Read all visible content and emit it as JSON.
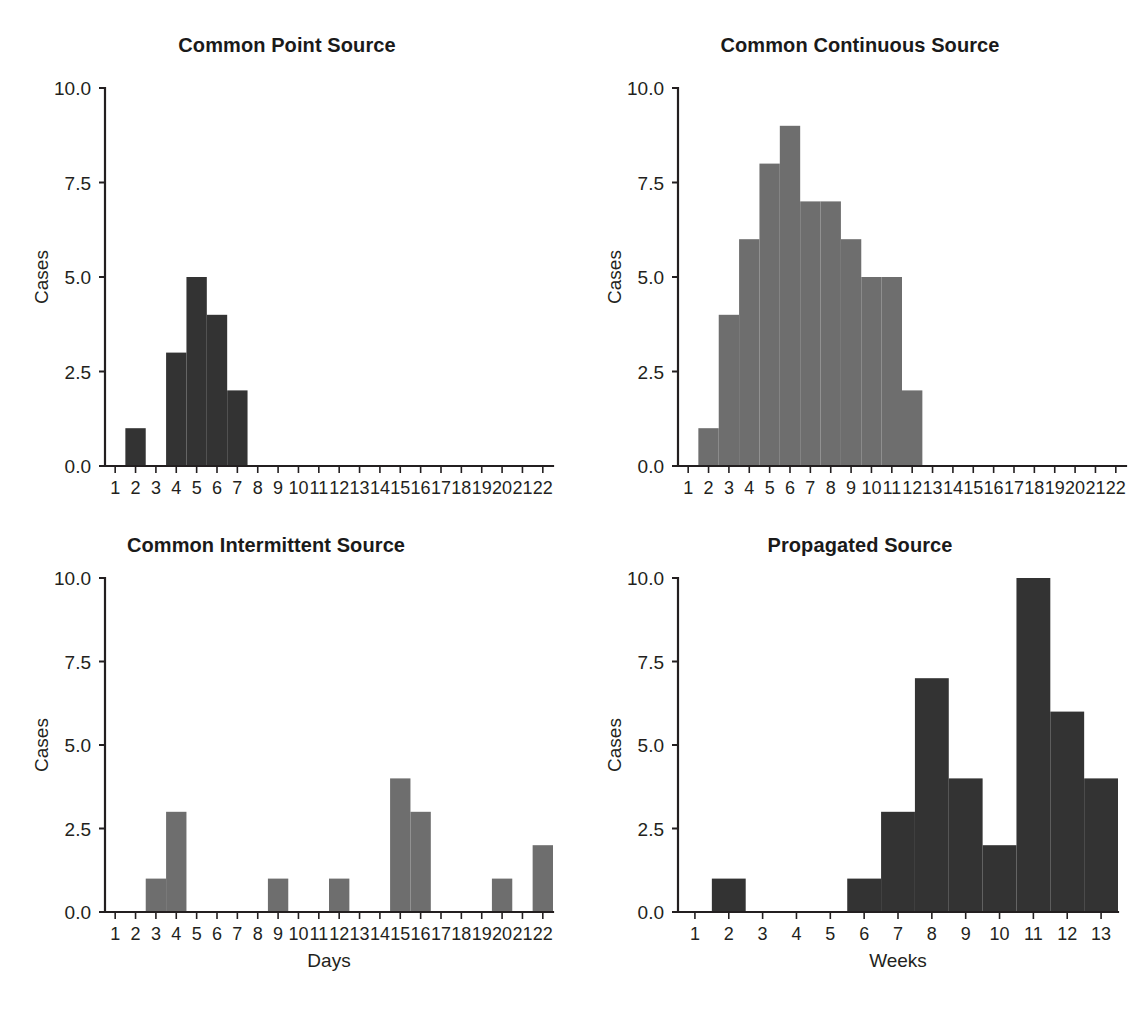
{
  "figure": {
    "background": "#ffffff",
    "bar_color_dark": "#333333",
    "bar_color_gray": "#6e6e6e",
    "axis_color": "#231f20"
  },
  "panels": [
    {
      "id": "common-point-source",
      "title": "Common Point Source",
      "xlabel": "Days",
      "ylabel": "Cases"
    },
    {
      "id": "common-continuous-source",
      "title": "Common Continuous Source",
      "xlabel": "Days",
      "ylabel": "Cases"
    },
    {
      "id": "common-intermittent-source",
      "title": "Common Intermittent Source",
      "xlabel": "Days",
      "ylabel": "Cases"
    },
    {
      "id": "propagated-source",
      "title": "Propagated Source",
      "xlabel": "Weeks",
      "ylabel": "Cases"
    }
  ],
  "chart_data": [
    {
      "type": "bar",
      "title": "Common Point Source",
      "xlabel": "Days",
      "ylabel": "Cases",
      "categories": [
        1,
        2,
        3,
        4,
        5,
        6,
        7,
        8,
        9,
        10,
        11,
        12,
        13,
        14,
        15,
        16,
        17,
        18,
        19,
        20,
        21,
        22
      ],
      "values": [
        0,
        1,
        0,
        3,
        5,
        4,
        2,
        0,
        0,
        0,
        0,
        0,
        0,
        0,
        0,
        0,
        0,
        0,
        0,
        0,
        0,
        0
      ],
      "ylim": [
        0,
        10
      ],
      "yticks": [
        0.0,
        2.5,
        5.0,
        7.5,
        10.0
      ],
      "ytick_labels": [
        "0.0",
        "2.5",
        "5.0",
        "7.5",
        "10.0"
      ],
      "xlim": [
        0.5,
        22.5
      ],
      "grid": false,
      "legend": false,
      "bar_color": "#333333"
    },
    {
      "type": "bar",
      "title": "Common Continuous Source",
      "xlabel": "Days",
      "ylabel": "Cases",
      "categories": [
        1,
        2,
        3,
        4,
        5,
        6,
        7,
        8,
        9,
        10,
        11,
        12,
        13,
        14,
        15,
        16,
        17,
        18,
        19,
        20,
        21,
        22
      ],
      "values": [
        0,
        1,
        4,
        6,
        8,
        9,
        7,
        7,
        6,
        5,
        5,
        2,
        0,
        0,
        0,
        0,
        0,
        0,
        0,
        0,
        0,
        0
      ],
      "ylim": [
        0,
        10
      ],
      "yticks": [
        0.0,
        2.5,
        5.0,
        7.5,
        10.0
      ],
      "ytick_labels": [
        "0.0",
        "2.5",
        "5.0",
        "7.5",
        "10.0"
      ],
      "xlim": [
        0.5,
        22.5
      ],
      "grid": false,
      "legend": false,
      "bar_color": "#6e6e6e"
    },
    {
      "type": "bar",
      "title": "Common Intermittent Source",
      "xlabel": "Days",
      "ylabel": "Cases",
      "categories": [
        1,
        2,
        3,
        4,
        5,
        6,
        7,
        8,
        9,
        10,
        11,
        12,
        13,
        14,
        15,
        16,
        17,
        18,
        19,
        20,
        21,
        22
      ],
      "values": [
        0,
        0,
        1,
        3,
        0,
        0,
        0,
        0,
        1,
        0,
        0,
        1,
        0,
        0,
        4,
        3,
        0,
        0,
        0,
        1,
        0,
        2
      ],
      "ylim": [
        0,
        10
      ],
      "yticks": [
        0.0,
        2.5,
        5.0,
        7.5,
        10.0
      ],
      "ytick_labels": [
        "0.0",
        "2.5",
        "5.0",
        "7.5",
        "10.0"
      ],
      "xlim": [
        0.5,
        22.5
      ],
      "grid": false,
      "legend": false,
      "bar_color": "#6e6e6e"
    },
    {
      "type": "bar",
      "title": "Propagated Source",
      "xlabel": "Weeks",
      "ylabel": "Cases",
      "categories": [
        1,
        2,
        3,
        4,
        5,
        6,
        7,
        8,
        9,
        10,
        11,
        12,
        13
      ],
      "values": [
        0,
        1,
        0,
        0,
        0,
        1,
        3,
        7,
        4,
        2,
        10,
        6,
        4
      ],
      "ylim": [
        0,
        10
      ],
      "yticks": [
        0.0,
        2.5,
        5.0,
        7.5,
        10.0
      ],
      "ytick_labels": [
        "0.0",
        "2.5",
        "5.0",
        "7.5",
        "10.0"
      ],
      "xlim": [
        0.5,
        13.5
      ],
      "grid": false,
      "legend": false,
      "bar_color": "#333333"
    }
  ],
  "caption": {
    "partial_text": ""
  }
}
